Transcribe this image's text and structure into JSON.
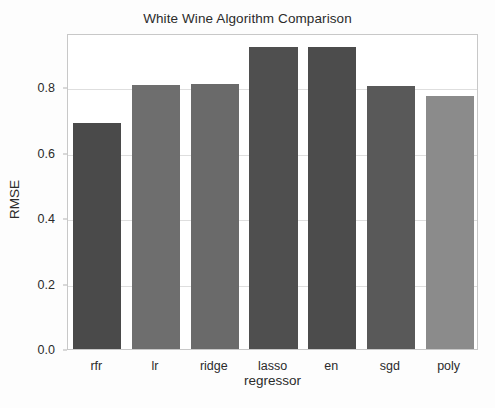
{
  "chart_data": {
    "type": "bar",
    "title": "White Wine Algorithm Comparison",
    "xlabel": "regressor",
    "ylabel": "RMSE",
    "categories": [
      "rfr",
      "lr",
      "ridge",
      "lasso",
      "en",
      "sgd",
      "poly"
    ],
    "values": [
      0.69,
      0.806,
      0.808,
      0.922,
      0.922,
      0.802,
      0.773
    ],
    "bar_colors": [
      "#4a4a4a",
      "#6e6e6e",
      "#6a6a6a",
      "#4f4f4f",
      "#4c4c4c",
      "#595959",
      "#8b8b8b"
    ],
    "ylim": [
      0.0,
      0.965
    ],
    "yticks": [
      0.0,
      0.2,
      0.4,
      0.6,
      0.8
    ],
    "ytick_labels": [
      "0.0",
      "0.2",
      "0.4",
      "0.6",
      "0.8"
    ],
    "grid": true,
    "grid_axis": "y",
    "legend": null,
    "legend_position": "none",
    "bar_width_fraction": 0.82,
    "background_color": "#ffffff",
    "axes_edge_color": "#c8c8c8",
    "text_color": "#2b2b2b"
  }
}
